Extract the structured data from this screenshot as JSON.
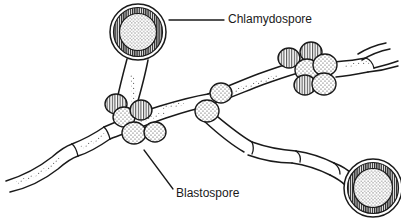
{
  "figure": {
    "background_color": "#ffffff",
    "ink_color": "#1a1a1a",
    "width": 401,
    "height": 218
  },
  "labels": [
    {
      "id": "chlamydospore",
      "text": "Chlamydospore",
      "x": 228,
      "y": 20,
      "leader": {
        "type": "horizontal",
        "x1": 169,
        "y1": 20,
        "x2": 224,
        "y2": 20
      }
    },
    {
      "id": "blastospore",
      "text": "Blastospore",
      "x": 176,
      "y": 194,
      "leader": {
        "type": "diagonal",
        "x1": 144,
        "y1": 150,
        "x2": 173,
        "y2": 189
      }
    }
  ],
  "structures": {
    "chlamydospores": [
      {
        "id": "chlamydospore-top-left",
        "cx": 138,
        "cy": 32,
        "r": 28,
        "ring_width": 6,
        "fill": "stipple"
      },
      {
        "id": "chlamydospore-bottom-right",
        "cx": 373,
        "cy": 188,
        "r": 29,
        "ring_width": 6,
        "fill": "stipple"
      }
    ],
    "blastospore_clusters": [
      {
        "id": "cluster-center",
        "spores": [
          {
            "cx": 116,
            "cy": 104,
            "rx": 11,
            "ry": 10,
            "fill": "hatch-vertical"
          },
          {
            "cx": 124,
            "cy": 117,
            "rx": 11,
            "ry": 10,
            "fill": "stipple"
          },
          {
            "cx": 141,
            "cy": 110,
            "rx": 11,
            "ry": 10,
            "fill": "hatch-vertical"
          },
          {
            "cx": 134,
            "cy": 133,
            "rx": 12,
            "ry": 11,
            "fill": "stipple"
          },
          {
            "cx": 155,
            "cy": 132,
            "rx": 11,
            "ry": 10,
            "fill": "stipple"
          }
        ]
      },
      {
        "id": "cluster-upper-right",
        "spores": [
          {
            "cx": 289,
            "cy": 58,
            "rx": 11,
            "ry": 10,
            "fill": "hatch-vertical"
          },
          {
            "cx": 311,
            "cy": 52,
            "rx": 11,
            "ry": 10,
            "fill": "hatch-vertical"
          },
          {
            "cx": 307,
            "cy": 70,
            "rx": 12,
            "ry": 11,
            "fill": "stipple"
          },
          {
            "cx": 325,
            "cy": 65,
            "rx": 12,
            "ry": 11,
            "fill": "stipple"
          },
          {
            "cx": 305,
            "cy": 85,
            "rx": 11,
            "ry": 10,
            "fill": "hatch-vertical"
          },
          {
            "cx": 324,
            "cy": 84,
            "rx": 12,
            "ry": 11,
            "fill": "stipple"
          }
        ]
      }
    ],
    "single_blastospores": [
      {
        "id": "blastospore-mid-upper",
        "cx": 221,
        "cy": 93,
        "rx": 11,
        "ry": 10,
        "fill": "stipple"
      },
      {
        "id": "blastospore-mid-lower",
        "cx": 207,
        "cy": 111,
        "rx": 12,
        "ry": 11,
        "fill": "stipple"
      }
    ],
    "hyphae": [
      {
        "id": "hypha-main-lower-left",
        "description": "segmented pseudohypha running from lower-left edge up to the center junction"
      },
      {
        "id": "hypha-upper-right",
        "description": "pseudohypha running from the center junction up to the right edge through the upper-right blastospore cluster"
      },
      {
        "id": "hypha-lower-right",
        "description": "segmented pseudohypha running from the center junction down to the bottom-right chlamydospore"
      },
      {
        "id": "hypha-chlamydospore-stalk",
        "description": "short suspensor stalk cell connecting the top-left chlamydospore to the center junction"
      }
    ]
  }
}
